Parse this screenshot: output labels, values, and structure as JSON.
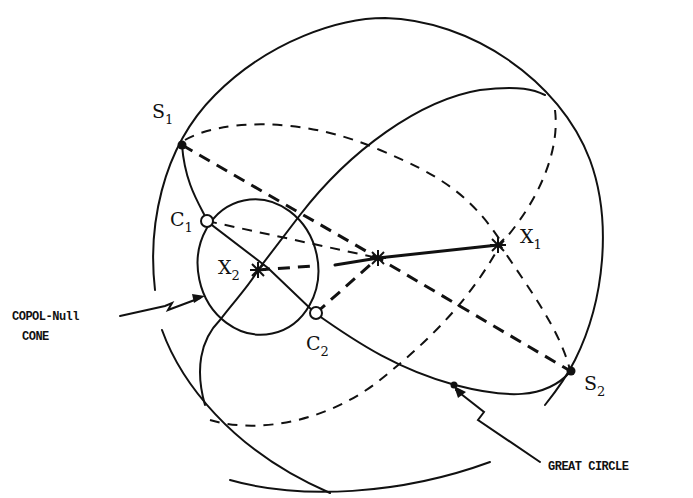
{
  "diagram": {
    "type": "poincare-sphere",
    "labels": {
      "s1": {
        "base": "S",
        "sub": "1"
      },
      "s2": {
        "base": "S",
        "sub": "2"
      },
      "c1": {
        "base": "C",
        "sub": "1"
      },
      "c2": {
        "base": "C",
        "sub": "2"
      },
      "x1": {
        "base": "X",
        "sub": "1"
      },
      "x2": {
        "base": "X",
        "sub": "2"
      }
    },
    "annotations": {
      "copol_line1": "COPOL-Null",
      "copol_line2": "CONE",
      "great_circle": "GREAT CIRCLE"
    },
    "colors": {
      "ink": "#111111",
      "background": "#ffffff"
    }
  }
}
